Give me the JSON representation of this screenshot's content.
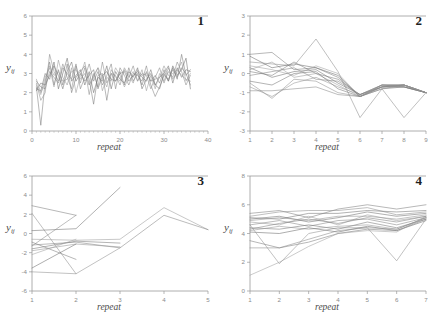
{
  "figure": {
    "top_caption": "",
    "panel_count": 4
  },
  "panels": [
    {
      "number": "1",
      "ylabel_main": "y",
      "ylabel_sub": "ij",
      "xlabel": "repeat",
      "ytick_labels": [
        "6",
        "5",
        "4",
        "3",
        "2",
        "1",
        "0"
      ],
      "xtick_labels": [
        "0",
        "10",
        "20",
        "30",
        "40"
      ]
    },
    {
      "number": "2",
      "ylabel_main": "y",
      "ylabel_sub": "ij",
      "xlabel": "repeat",
      "ytick_labels": [
        "3",
        "2",
        "1",
        "0",
        "-1",
        "-2",
        "-3"
      ],
      "xtick_labels": [
        "1",
        "2",
        "3",
        "4",
        "5",
        "6",
        "7",
        "8",
        "9"
      ]
    },
    {
      "number": "3",
      "ylabel_main": "y",
      "ylabel_sub": "ij",
      "xlabel": "repeat",
      "ytick_labels": [
        "6",
        "4",
        "2",
        "0",
        "-2",
        "-4",
        "-6"
      ],
      "xtick_labels": [
        "1",
        "2",
        "3",
        "4",
        "5"
      ]
    },
    {
      "number": "4",
      "ylabel_main": "y",
      "ylabel_sub": "ij",
      "xlabel": "repeat",
      "ytick_labels": [
        "8",
        "6",
        "4",
        "2",
        "0"
      ],
      "xtick_labels": [
        "1",
        "2",
        "3",
        "4",
        "5",
        "6",
        "7"
      ]
    }
  ],
  "chart_data": [
    {
      "type": "line",
      "title": "1",
      "xlabel": "repeat",
      "ylabel": "y_ij",
      "xlim": [
        0,
        40
      ],
      "ylim": [
        0,
        6
      ],
      "xticks": [
        0,
        10,
        20,
        30,
        40
      ],
      "yticks": [
        0,
        1,
        2,
        3,
        4,
        5,
        6
      ],
      "grid": false,
      "legend": "none",
      "x": [
        1,
        2,
        3,
        4,
        5,
        6,
        7,
        8,
        9,
        10,
        11,
        12,
        13,
        14,
        15,
        16,
        17,
        18,
        19,
        20,
        21,
        22,
        23,
        24,
        25,
        26,
        27,
        28,
        29,
        30,
        31,
        32,
        33,
        34,
        35,
        36
      ],
      "series": [
        {
          "name": "subject 1",
          "values": [
            2.3,
            0.3,
            2.6,
            3.6,
            2.4,
            3.2,
            2.4,
            3.5,
            2.0,
            2.8,
            3.1,
            3.4,
            2.7,
            1.4,
            2.9,
            3.0,
            1.6,
            3.0,
            2.6,
            3.1,
            2.4,
            3.3,
            2.6,
            3.0,
            2.4,
            3.1,
            2.6,
            2.9,
            2.5,
            3.2,
            2.6,
            3.3,
            2.7,
            4.0,
            2.9,
            3.2
          ]
        },
        {
          "name": "subject 2",
          "values": [
            2.5,
            1.6,
            2.0,
            4.0,
            3.1,
            2.6,
            3.5,
            2.8,
            2.2,
            3.4,
            2.5,
            3.3,
            1.9,
            3.0,
            2.3,
            3.6,
            2.5,
            3.0,
            2.9,
            2.4,
            3.2,
            2.8,
            3.4,
            2.6,
            3.0,
            2.9,
            2.2,
            2.8,
            3.3,
            2.5,
            3.1,
            2.8,
            3.6,
            3.1,
            2.4,
            2.9
          ]
        },
        {
          "name": "subject 3",
          "values": [
            2.2,
            2.1,
            3.0,
            2.7,
            3.6,
            2.2,
            3.0,
            3.8,
            2.6,
            2.9,
            3.2,
            2.4,
            3.1,
            2.0,
            2.8,
            2.6,
            3.4,
            2.2,
            3.1,
            2.7,
            2.5,
            3.1,
            2.8,
            3.3,
            2.2,
            2.7,
            3.0,
            2.4,
            2.8,
            3.0,
            2.6,
            3.4,
            2.9,
            3.2,
            3.8,
            2.2
          ]
        },
        {
          "name": "subject 4",
          "values": [
            2.4,
            1.9,
            2.8,
            3.3,
            2.3,
            3.7,
            2.8,
            2.4,
            3.3,
            2.0,
            2.9,
            3.6,
            2.4,
            2.8,
            3.3,
            2.1,
            2.8,
            2.6,
            3.3,
            2.9,
            2.3,
            2.8,
            3.1,
            2.6,
            3.2,
            2.1,
            2.9,
            2.2,
            3.0,
            2.6,
            3.3,
            2.7,
            3.1,
            3.6,
            2.6,
            3.0
          ]
        },
        {
          "name": "subject 5",
          "values": [
            2.6,
            2.3,
            2.2,
            3.1,
            2.8,
            2.5,
            3.3,
            3.0,
            2.7,
            3.5,
            2.2,
            2.8,
            3.5,
            2.6,
            3.1,
            2.4,
            2.9,
            3.5,
            2.2,
            3.3,
            2.9,
            2.4,
            3.0,
            2.9,
            2.6,
            3.4,
            2.4,
            1.8,
            2.3,
            2.9,
            2.7,
            3.2,
            2.8,
            3.3,
            3.0,
            2.4
          ]
        },
        {
          "name": "subject 6",
          "values": [
            2.1,
            2.5,
            2.4,
            2.9,
            3.4,
            2.9,
            2.2,
            3.1,
            3.6,
            2.6,
            3.0,
            2.6,
            2.9,
            3.2,
            2.2,
            2.9,
            3.1,
            2.7,
            2.6,
            3.0,
            3.1,
            2.6,
            2.9,
            3.1,
            2.8,
            2.6,
            3.2,
            2.4,
            2.2,
            3.0,
            3.4,
            2.5,
            3.3,
            2.8,
            3.2,
            3.1
          ]
        },
        {
          "name": "subject 7",
          "values": [
            2.7,
            2.0,
            2.5,
            3.4,
            2.9,
            3.1,
            2.6,
            2.7,
            3.1,
            3.2,
            2.7,
            3.0,
            2.4,
            2.9,
            3.3,
            2.8,
            2.3,
            3.2,
            2.8,
            2.6,
            3.3,
            2.9,
            2.5,
            3.2,
            2.9,
            3.0,
            2.6,
            2.7,
            2.8,
            3.4,
            2.9,
            3.0,
            3.2,
            2.9,
            2.7,
            2.6
          ]
        }
      ]
    },
    {
      "type": "line",
      "title": "2",
      "xlabel": "repeat",
      "ylabel": "y_ij",
      "xlim": [
        1,
        9
      ],
      "ylim": [
        -3,
        3
      ],
      "xticks": [
        1,
        2,
        3,
        4,
        5,
        6,
        7,
        8,
        9
      ],
      "yticks": [
        -3,
        -2,
        -1,
        0,
        1,
        2,
        3
      ],
      "grid": false,
      "legend": "none",
      "x": [
        1,
        2,
        3,
        4,
        5,
        6,
        7,
        8,
        9
      ],
      "series": [
        {
          "name": "s1",
          "values": [
            1.0,
            1.1,
            0.2,
            0.3,
            -0.2,
            -1.2,
            -0.7,
            -0.6,
            -1.0
          ]
        },
        {
          "name": "s2",
          "values": [
            0.6,
            0.5,
            0.4,
            1.8,
            0.1,
            -2.3,
            -0.8,
            -2.3,
            -1.0
          ]
        },
        {
          "name": "s3",
          "values": [
            0.3,
            -0.2,
            0.1,
            0.2,
            -0.5,
            -1.1,
            -0.6,
            -0.6,
            -1.0
          ]
        },
        {
          "name": "s4",
          "values": [
            0.2,
            0.6,
            -0.2,
            0.0,
            -0.6,
            -1.2,
            -0.7,
            -0.7,
            -1.0
          ]
        },
        {
          "name": "s5",
          "values": [
            -0.1,
            0.1,
            0.3,
            -0.3,
            -0.4,
            -1.1,
            -0.6,
            -0.6,
            -1.0
          ]
        },
        {
          "name": "s6",
          "values": [
            -0.4,
            -0.6,
            0.0,
            0.1,
            -0.8,
            -1.2,
            -0.8,
            -0.7,
            -1.0
          ]
        },
        {
          "name": "s7",
          "values": [
            -0.7,
            -1.2,
            -0.5,
            -0.2,
            -0.7,
            -1.1,
            -0.7,
            -0.6,
            -1.0
          ]
        },
        {
          "name": "s8",
          "values": [
            0.9,
            0.3,
            0.5,
            0.3,
            -0.1,
            -1.2,
            -0.6,
            -0.7,
            -1.0
          ]
        },
        {
          "name": "s9",
          "values": [
            -0.5,
            -1.3,
            -0.3,
            -0.4,
            -1.0,
            -1.2,
            -0.8,
            -0.6,
            -1.0
          ]
        },
        {
          "name": "s10",
          "values": [
            0.1,
            -0.1,
            0.6,
            0.0,
            -0.3,
            -1.1,
            -0.7,
            -0.6,
            -1.0
          ]
        },
        {
          "name": "s11",
          "values": [
            -0.9,
            -0.9,
            -0.8,
            -0.7,
            -1.1,
            -1.2,
            -0.7,
            -0.7,
            -1.0
          ]
        },
        {
          "name": "s12",
          "values": [
            0.4,
            0.2,
            -0.1,
            0.4,
            0.0,
            -1.2,
            -0.6,
            -0.6,
            -1.0
          ]
        }
      ]
    },
    {
      "type": "line",
      "title": "3",
      "xlabel": "repeat",
      "ylabel": "y_ij",
      "xlim": [
        1,
        5
      ],
      "ylim": [
        -6,
        6
      ],
      "xticks": [
        1,
        2,
        3,
        4,
        5
      ],
      "yticks": [
        -6,
        -4,
        -2,
        0,
        2,
        4,
        6
      ],
      "grid": false,
      "legend": "none",
      "x": [
        1,
        2,
        3,
        4,
        5
      ],
      "series": [
        {
          "name": "s1",
          "values": [
            2.9,
            1.9,
            null,
            null,
            null
          ]
        },
        {
          "name": "s2",
          "values": [
            2.1,
            -4.2,
            null,
            null,
            null
          ]
        },
        {
          "name": "s3",
          "values": [
            0.3,
            0.5,
            4.8,
            null,
            null
          ]
        },
        {
          "name": "s4",
          "values": [
            -0.6,
            -0.7,
            -0.6,
            2.7,
            0.4
          ]
        },
        {
          "name": "s5",
          "values": [
            -1.2,
            -0.9,
            -1.5,
            1.9,
            0.4
          ]
        },
        {
          "name": "s6",
          "values": [
            -1.6,
            -0.8,
            -1.0,
            null,
            null
          ]
        },
        {
          "name": "s7",
          "values": [
            -1.8,
            -1.1,
            -1.4,
            null,
            null
          ]
        },
        {
          "name": "s8",
          "values": [
            -3.6,
            -1.1,
            null,
            null,
            null
          ]
        },
        {
          "name": "s9",
          "values": [
            -4.0,
            -4.2,
            -1.5,
            null,
            null
          ]
        },
        {
          "name": "s10",
          "values": [
            -0.9,
            -2.7,
            null,
            null,
            null
          ]
        },
        {
          "name": "s11",
          "values": [
            -1.3,
            1.9,
            null,
            null,
            null
          ]
        },
        {
          "name": "s12",
          "values": [
            -2.2,
            -0.6,
            null,
            null,
            null
          ]
        }
      ]
    },
    {
      "type": "line",
      "title": "4",
      "xlabel": "repeat",
      "ylabel": "y_ij",
      "xlim": [
        1,
        7
      ],
      "ylim": [
        0,
        8
      ],
      "xticks": [
        1,
        2,
        3,
        4,
        5,
        6,
        7
      ],
      "yticks": [
        0,
        2,
        4,
        6,
        8
      ],
      "grid": false,
      "legend": "none",
      "x": [
        1,
        2,
        3,
        4,
        5,
        6,
        7
      ],
      "series": [
        {
          "name": "s1",
          "values": [
            5.4,
            5.6,
            5.1,
            5.7,
            6.0,
            5.7,
            6.0
          ]
        },
        {
          "name": "s2",
          "values": [
            5.2,
            5.5,
            5.6,
            5.6,
            5.8,
            5.3,
            5.5
          ]
        },
        {
          "name": "s3",
          "values": [
            5.0,
            5.2,
            4.8,
            5.1,
            5.5,
            5.2,
            5.4
          ]
        },
        {
          "name": "s4",
          "values": [
            4.8,
            4.6,
            5.2,
            4.6,
            5.3,
            4.9,
            5.2
          ]
        },
        {
          "name": "s5",
          "values": [
            4.6,
            4.9,
            4.5,
            4.9,
            5.0,
            4.6,
            5.1
          ]
        },
        {
          "name": "s6",
          "values": [
            4.4,
            4.3,
            4.6,
            4.3,
            4.8,
            4.4,
            5.0
          ]
        },
        {
          "name": "s7",
          "values": [
            4.2,
            4.5,
            4.3,
            4.5,
            4.6,
            4.3,
            5.1
          ]
        },
        {
          "name": "s8",
          "values": [
            4.1,
            4.0,
            4.4,
            4.1,
            4.5,
            4.2,
            4.9
          ]
        },
        {
          "name": "s9",
          "values": [
            4.6,
            1.9,
            4.0,
            4.4,
            4.4,
            2.1,
            5.0
          ]
        },
        {
          "name": "s10",
          "values": [
            3.5,
            3.0,
            3.4,
            4.0,
            4.3,
            4.2,
            5.0
          ]
        },
        {
          "name": "s11",
          "values": [
            3.0,
            3.0,
            3.6,
            4.2,
            4.4,
            4.3,
            5.1
          ]
        },
        {
          "name": "s12",
          "values": [
            1.1,
            2.0,
            3.1,
            4.0,
            4.2,
            4.1,
            5.2
          ]
        },
        {
          "name": "s13",
          "values": [
            5.1,
            5.0,
            5.4,
            5.4,
            5.6,
            5.5,
            5.6
          ]
        },
        {
          "name": "s14",
          "values": [
            4.9,
            5.1,
            4.9,
            5.2,
            5.2,
            5.0,
            5.3
          ]
        },
        {
          "name": "s15",
          "values": [
            4.3,
            4.7,
            5.0,
            4.7,
            5.1,
            4.8,
            5.2
          ]
        }
      ]
    }
  ]
}
